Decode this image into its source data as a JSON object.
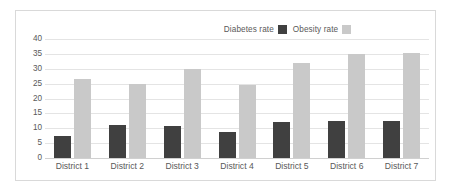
{
  "chart_data": {
    "type": "bar",
    "title": "",
    "xlabel": "",
    "ylabel": "",
    "ylim": [
      0,
      40
    ],
    "ytick_step": 5,
    "yticks": [
      40,
      35,
      30,
      25,
      20,
      15,
      10,
      5,
      0
    ],
    "grid": true,
    "legend_position": "top-right",
    "categories": [
      "District 1",
      "District 2",
      "District 3",
      "District 4",
      "District 5",
      "District 6",
      "District 7"
    ],
    "series": [
      {
        "name": "Diabetes rate",
        "color": "#404040",
        "values": [
          7.5,
          11.2,
          10.8,
          8.7,
          12.2,
          12.6,
          12.5
        ]
      },
      {
        "name": "Obesity rate",
        "color": "#c9c9c9",
        "values": [
          26.4,
          24.9,
          30.0,
          24.5,
          31.8,
          34.8,
          35.2
        ]
      }
    ]
  },
  "colors": {
    "diabetes": "#404040",
    "obesity": "#c9c9c9",
    "gridline": "#e4e4e4",
    "axis": "#d0d0d0",
    "border": "#d9d9d9",
    "text": "#595959",
    "background": "#ffffff"
  }
}
